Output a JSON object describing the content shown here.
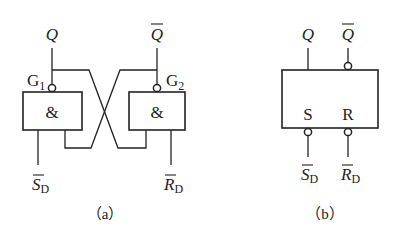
{
  "figure": {
    "panel_a": {
      "caption": "（a）",
      "gate1": {
        "label": "G",
        "index": "1",
        "symbol": "&"
      },
      "gate2": {
        "label": "G",
        "index": "2",
        "symbol": "&"
      },
      "output_q": "Q",
      "output_q_bar": "Q",
      "input_s": {
        "main": "S",
        "sub": "D"
      },
      "input_r": {
        "main": "R",
        "sub": "D"
      }
    },
    "panel_b": {
      "caption": "（b）",
      "pin_s": "S",
      "pin_r": "R",
      "output_q": "Q",
      "output_q_bar": "Q",
      "input_s": {
        "main": "S",
        "sub": "D"
      },
      "input_r": {
        "main": "R",
        "sub": "D"
      }
    }
  }
}
